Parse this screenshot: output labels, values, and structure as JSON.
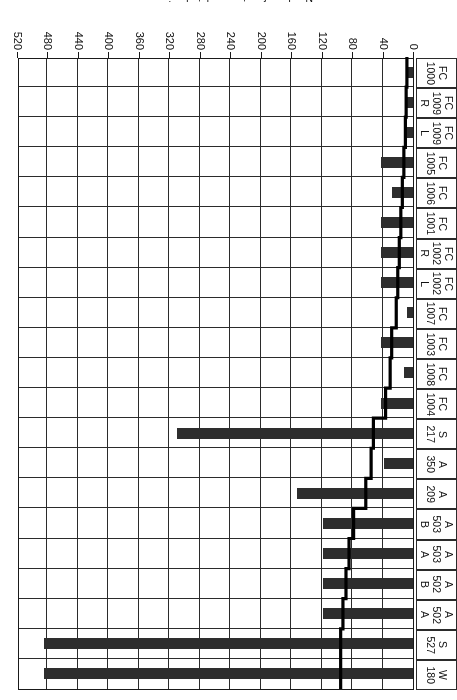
{
  "chart_data": {
    "type": "bar",
    "title": "",
    "subtitle": "",
    "xlabel": "",
    "ylabel": "Number of parts completed or in progress",
    "orientation": "horizontal",
    "grid": true,
    "legend": "none",
    "axis_ticks": [
      0,
      40,
      80,
      120,
      160,
      200,
      240,
      280,
      320,
      360,
      400,
      440,
      480,
      520
    ],
    "xlim": [
      0,
      520
    ],
    "categories": [
      "W 180",
      "S 527",
      "A 502 A",
      "A 502 B",
      "A 503 A",
      "A 503 B",
      "A 209",
      "A 350",
      "S 217",
      "FC 1004",
      "FC 1008",
      "FC 1003",
      "FC 1007",
      "FC 1002 L",
      "FC 1002 R",
      "FC 1001",
      "FC 1006",
      "FC 1005",
      "FC 1009 L",
      "FC 1009 R",
      "FC 1000"
    ],
    "category_lines": [
      [
        "W",
        "180"
      ],
      [
        "S",
        "527"
      ],
      [
        "A",
        "502",
        "A"
      ],
      [
        "A",
        "502",
        "B"
      ],
      [
        "A",
        "503",
        "A"
      ],
      [
        "A",
        "503",
        "B"
      ],
      [
        "A",
        "209"
      ],
      [
        "A",
        "350"
      ],
      [
        "S",
        "217"
      ],
      [
        "FC",
        "1004"
      ],
      [
        "FC",
        "1008"
      ],
      [
        "FC",
        "1003"
      ],
      [
        "FC",
        "1007"
      ],
      [
        "FC",
        "1002",
        "L"
      ],
      [
        "FC",
        "1002",
        "R"
      ],
      [
        "FC",
        "1001"
      ],
      [
        "FC",
        "1006"
      ],
      [
        "FC",
        "1005"
      ],
      [
        "FC",
        "1009",
        "L"
      ],
      [
        "FC",
        "1009",
        "R"
      ],
      [
        "FC",
        "1000"
      ]
    ],
    "values": [
      485,
      485,
      118,
      118,
      118,
      118,
      152,
      38,
      310,
      42,
      12,
      42,
      8,
      42,
      42,
      42,
      27,
      42,
      8,
      8,
      8
    ],
    "step_line": [
      95,
      95,
      92,
      88,
      84,
      78,
      62,
      55,
      52,
      36,
      30,
      28,
      22,
      20,
      18,
      16,
      14,
      12,
      10,
      9,
      8
    ],
    "colors": {
      "bar": "#2e2e2e",
      "line": "#000000",
      "grid": "#2b2b2b",
      "axis": "#1a1a1a",
      "background": "#ffffff"
    }
  },
  "axis": {
    "value_axis_title": "Number of parts completed or in progress"
  }
}
